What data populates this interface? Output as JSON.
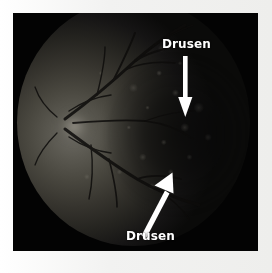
{
  "figure": {
    "kind": "retinal-fundus-photograph",
    "modality": "fundus autofluorescence / red-free fundus photograph",
    "eye_region": "posterior pole with optic disc and macula",
    "frame_color": "#f7f7f6",
    "plate_color": "#030303"
  },
  "annotations": {
    "label_color": "#ffffff",
    "arrow_color": "#ffffff",
    "items": [
      {
        "id": "drusen-top",
        "label": "Drusen",
        "arrow": "down-arrow-icon",
        "arrow_direction": "down",
        "label_position": "above-arrow"
      },
      {
        "id": "drusen-bottom",
        "label": "Drusen",
        "arrow": "up-right-arrow-icon",
        "arrow_direction": "up-right",
        "label_position": "below-arrow"
      }
    ]
  }
}
